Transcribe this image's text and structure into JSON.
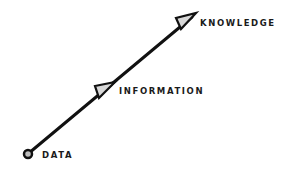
{
  "diagram": {
    "nodes": [
      {
        "id": "data",
        "label": "DATA"
      },
      {
        "id": "information",
        "label": "INFORMATION"
      },
      {
        "id": "knowledge",
        "label": "KNOWLEDGE"
      }
    ],
    "colors": {
      "line": "#111111",
      "arrow_fill": "#d8d8d8",
      "node_fill": "#bdbdbd",
      "text": "#1a1a1a"
    }
  }
}
